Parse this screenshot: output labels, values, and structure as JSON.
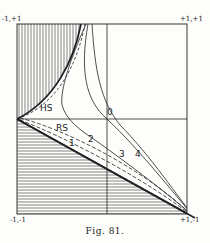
{
  "figure": {
    "caption": "Fig. 81.",
    "corners": {
      "top_left": "-1,+1",
      "top_right": "+1,+1",
      "bottom_left": "-1,-1",
      "bottom_right": "+1,-1"
    },
    "origin_label": "0",
    "curve_labels": {
      "hs": "HS",
      "rs": "RS",
      "c1": "1",
      "c2": "2",
      "c3": "3",
      "c4": "4"
    },
    "colors": {
      "ink": "#222222",
      "paper": "#fdfdfb"
    }
  }
}
